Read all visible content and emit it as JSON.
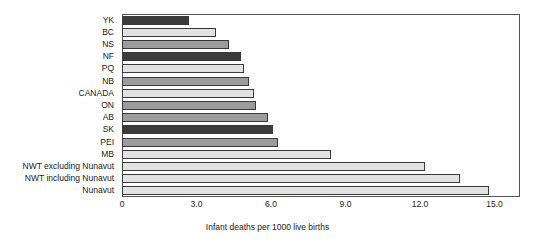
{
  "chart_data": {
    "type": "bar",
    "orientation": "horizontal",
    "title": "",
    "subtitle": "",
    "xlabel": "Infant deaths per 1000 live births",
    "ylabel": "",
    "xlim": [
      0,
      16.03
    ],
    "xticks": [
      0,
      3.0,
      6.0,
      9.0,
      12.0,
      15.0
    ],
    "xtick_labels": [
      "0",
      "3.0",
      "6.0",
      "9.0",
      "12.0",
      "15.0"
    ],
    "grid": false,
    "legend": null,
    "categories": [
      "YK",
      "BC",
      "NS",
      "NF",
      "PQ",
      "NB",
      "CANADA",
      "ON",
      "AB",
      "SK",
      "PEI",
      "MB",
      "NWT excluding Nunavut",
      "NWT including Nunavut",
      "Nunavut"
    ],
    "values": [
      2.7,
      3.8,
      4.3,
      4.8,
      4.9,
      5.1,
      5.3,
      5.4,
      5.9,
      6.1,
      6.3,
      8.4,
      12.2,
      13.6,
      14.8
    ],
    "bar_tones": [
      "dark",
      "light",
      "medium",
      "dark",
      "light",
      "medium",
      "light",
      "medium",
      "medium",
      "dark",
      "medium",
      "light",
      "light",
      "light",
      "light"
    ]
  }
}
